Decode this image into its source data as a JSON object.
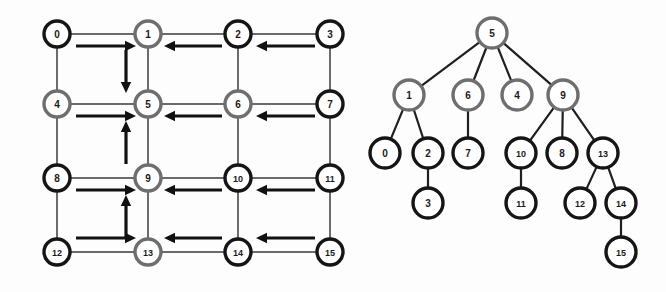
{
  "figure": {
    "background_color": "#fdfdfd",
    "node_black_color": "#151515",
    "node_gray_color": "#6e6e6e",
    "node_fill_color": "#ffffff",
    "edge_color": "#3a3a3a",
    "arrow_color": "#111111",
    "tree_edge_color": "#1f1f1f"
  },
  "left_panel": {
    "name": "grid-graph",
    "rows": 4,
    "cols": 4,
    "node_radius": 13,
    "nodes": [
      {
        "id": "0",
        "label": "0",
        "x": 57,
        "y": 34,
        "style": "black"
      },
      {
        "id": "1",
        "label": "1",
        "x": 148,
        "y": 34,
        "style": "gray"
      },
      {
        "id": "2",
        "label": "2",
        "x": 238,
        "y": 34,
        "style": "black"
      },
      {
        "id": "3",
        "label": "3",
        "x": 330,
        "y": 34,
        "style": "black"
      },
      {
        "id": "4",
        "label": "4",
        "x": 57,
        "y": 104,
        "style": "gray"
      },
      {
        "id": "5",
        "label": "5",
        "x": 148,
        "y": 104,
        "style": "gray"
      },
      {
        "id": "6",
        "label": "6",
        "x": 238,
        "y": 104,
        "style": "gray"
      },
      {
        "id": "7",
        "label": "7",
        "x": 330,
        "y": 104,
        "style": "black"
      },
      {
        "id": "8",
        "label": "8",
        "x": 57,
        "y": 178,
        "style": "black"
      },
      {
        "id": "9",
        "label": "9",
        "x": 148,
        "y": 178,
        "style": "gray"
      },
      {
        "id": "10",
        "label": "10",
        "x": 238,
        "y": 178,
        "style": "black"
      },
      {
        "id": "11",
        "label": "11",
        "x": 330,
        "y": 178,
        "style": "black"
      },
      {
        "id": "12",
        "label": "12",
        "x": 57,
        "y": 252,
        "style": "black"
      },
      {
        "id": "13",
        "label": "13",
        "x": 148,
        "y": 252,
        "style": "gray"
      },
      {
        "id": "14",
        "label": "14",
        "x": 238,
        "y": 252,
        "style": "black"
      },
      {
        "id": "15",
        "label": "15",
        "x": 330,
        "y": 252,
        "style": "black"
      }
    ],
    "edges": [
      {
        "from": "0",
        "to": "1"
      },
      {
        "from": "1",
        "to": "2"
      },
      {
        "from": "2",
        "to": "3"
      },
      {
        "from": "4",
        "to": "5"
      },
      {
        "from": "5",
        "to": "6"
      },
      {
        "from": "6",
        "to": "7"
      },
      {
        "from": "8",
        "to": "9"
      },
      {
        "from": "9",
        "to": "10"
      },
      {
        "from": "10",
        "to": "11"
      },
      {
        "from": "12",
        "to": "13"
      },
      {
        "from": "13",
        "to": "14"
      },
      {
        "from": "14",
        "to": "15"
      },
      {
        "from": "0",
        "to": "4"
      },
      {
        "from": "4",
        "to": "8"
      },
      {
        "from": "8",
        "to": "12"
      },
      {
        "from": "1",
        "to": "5"
      },
      {
        "from": "5",
        "to": "9"
      },
      {
        "from": "9",
        "to": "13"
      },
      {
        "from": "2",
        "to": "6"
      },
      {
        "from": "6",
        "to": "10"
      },
      {
        "from": "10",
        "to": "14"
      },
      {
        "from": "3",
        "to": "7"
      },
      {
        "from": "7",
        "to": "11"
      },
      {
        "from": "11",
        "to": "15"
      }
    ],
    "arrows": [
      {
        "from": "0",
        "to": "1",
        "direction": "right",
        "x1": 76,
        "y1": 46,
        "x2": 136,
        "y2": 46
      },
      {
        "from": "2",
        "to": "1",
        "direction": "left",
        "x1": 222,
        "y1": 46,
        "x2": 164,
        "y2": 46
      },
      {
        "from": "3",
        "to": "2",
        "direction": "left",
        "x1": 315,
        "y1": 46,
        "x2": 256,
        "y2": 46
      },
      {
        "from": "1",
        "to": "5",
        "direction": "down",
        "x1": 126,
        "y1": 50,
        "x2": 126,
        "y2": 93
      },
      {
        "from": "4",
        "to": "5",
        "direction": "right",
        "x1": 76,
        "y1": 116,
        "x2": 136,
        "y2": 116
      },
      {
        "from": "6",
        "to": "5",
        "direction": "left",
        "x1": 222,
        "y1": 116,
        "x2": 164,
        "y2": 116
      },
      {
        "from": "7",
        "to": "6",
        "direction": "left",
        "x1": 315,
        "y1": 116,
        "x2": 256,
        "y2": 116
      },
      {
        "from": "9",
        "to": "5",
        "direction": "up",
        "x1": 126,
        "y1": 164,
        "x2": 126,
        "y2": 121
      },
      {
        "from": "8",
        "to": "9",
        "direction": "right",
        "x1": 76,
        "y1": 190,
        "x2": 136,
        "y2": 190
      },
      {
        "from": "10",
        "to": "9",
        "direction": "left",
        "x1": 222,
        "y1": 190,
        "x2": 164,
        "y2": 190
      },
      {
        "from": "11",
        "to": "10",
        "direction": "left",
        "x1": 315,
        "y1": 190,
        "x2": 256,
        "y2": 190
      },
      {
        "from": "13",
        "to": "9",
        "direction": "up",
        "x1": 126,
        "y1": 238,
        "x2": 126,
        "y2": 195
      },
      {
        "from": "12",
        "to": "13",
        "direction": "right",
        "x1": 76,
        "y1": 238,
        "x2": 136,
        "y2": 238
      },
      {
        "from": "14",
        "to": "13",
        "direction": "left",
        "x1": 222,
        "y1": 238,
        "x2": 164,
        "y2": 238
      },
      {
        "from": "15",
        "to": "14",
        "direction": "left",
        "x1": 315,
        "y1": 238,
        "x2": 256,
        "y2": 238
      }
    ]
  },
  "right_panel": {
    "name": "spanning-tree",
    "root": "5",
    "node_radius": 15,
    "nodes": [
      {
        "id": "5",
        "label": "5",
        "x": 492,
        "y": 33,
        "style": "gray",
        "level": 0
      },
      {
        "id": "1",
        "label": "1",
        "x": 409,
        "y": 95,
        "style": "gray",
        "level": 1
      },
      {
        "id": "6",
        "label": "6",
        "x": 468,
        "y": 95,
        "style": "gray",
        "level": 1
      },
      {
        "id": "4",
        "label": "4",
        "x": 517,
        "y": 95,
        "style": "gray",
        "level": 1
      },
      {
        "id": "9",
        "label": "9",
        "x": 563,
        "y": 95,
        "style": "gray",
        "level": 1
      },
      {
        "id": "0",
        "label": "0",
        "x": 385,
        "y": 153,
        "style": "black",
        "level": 2
      },
      {
        "id": "2",
        "label": "2",
        "x": 428,
        "y": 153,
        "style": "black",
        "level": 2
      },
      {
        "id": "7",
        "label": "7",
        "x": 468,
        "y": 153,
        "style": "black",
        "level": 2
      },
      {
        "id": "10",
        "label": "10",
        "x": 521,
        "y": 153,
        "style": "black",
        "level": 2
      },
      {
        "id": "8",
        "label": "8",
        "x": 562,
        "y": 153,
        "style": "black",
        "level": 2
      },
      {
        "id": "13",
        "label": "13",
        "x": 603,
        "y": 153,
        "style": "black",
        "level": 2
      },
      {
        "id": "3",
        "label": "3",
        "x": 428,
        "y": 203,
        "style": "black",
        "level": 3
      },
      {
        "id": "11",
        "label": "11",
        "x": 521,
        "y": 203,
        "style": "black",
        "level": 3
      },
      {
        "id": "12",
        "label": "12",
        "x": 580,
        "y": 203,
        "style": "black",
        "level": 3
      },
      {
        "id": "14",
        "label": "14",
        "x": 621,
        "y": 203,
        "style": "black",
        "level": 3
      },
      {
        "id": "15",
        "label": "15",
        "x": 621,
        "y": 252,
        "style": "black",
        "level": 4
      }
    ],
    "edges": [
      {
        "from": "5",
        "to": "1"
      },
      {
        "from": "5",
        "to": "6"
      },
      {
        "from": "5",
        "to": "4"
      },
      {
        "from": "5",
        "to": "9"
      },
      {
        "from": "1",
        "to": "0"
      },
      {
        "from": "1",
        "to": "2"
      },
      {
        "from": "6",
        "to": "7"
      },
      {
        "from": "9",
        "to": "10"
      },
      {
        "from": "9",
        "to": "8"
      },
      {
        "from": "9",
        "to": "13"
      },
      {
        "from": "2",
        "to": "3"
      },
      {
        "from": "10",
        "to": "11"
      },
      {
        "from": "13",
        "to": "12"
      },
      {
        "from": "13",
        "to": "14"
      },
      {
        "from": "14",
        "to": "15"
      }
    ]
  }
}
